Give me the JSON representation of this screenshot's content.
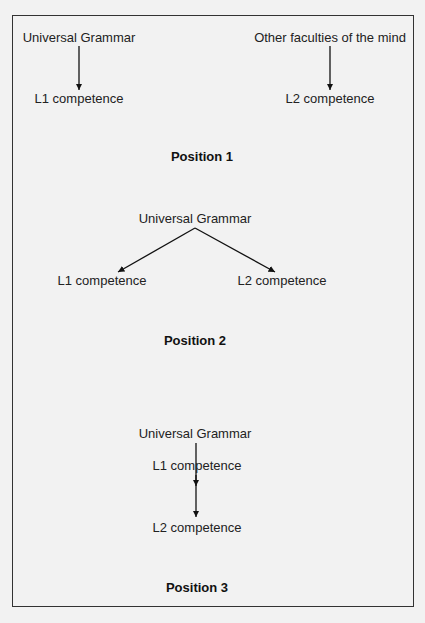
{
  "diagram": {
    "position1": {
      "title": "Position 1",
      "left_source": "Universal Grammar",
      "left_target": "L1 competence",
      "right_source": "Other faculties of the mind",
      "right_target": "L2 competence"
    },
    "position2": {
      "title": "Position 2",
      "source": "Universal Grammar",
      "left_target": "L1 competence",
      "right_target": "L2 competence"
    },
    "position3": {
      "title": "Position 3",
      "source": "Universal Grammar",
      "middle": "L1 competence",
      "target": "L2 competence"
    }
  },
  "colors": {
    "background": "#f2f2f2",
    "line": "#111111",
    "border": "#333333"
  }
}
